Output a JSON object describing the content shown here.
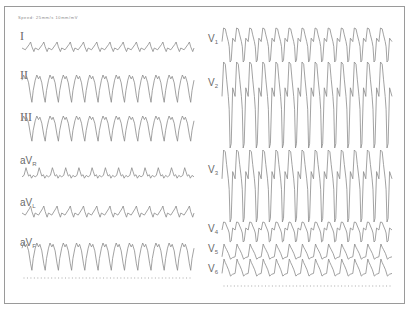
{
  "header": {
    "text": "Speed: 25mm/s  10mm/mV"
  },
  "leads_left": [
    {
      "id": "I",
      "label": "I",
      "sub": "",
      "label_x": 20,
      "label_y": 31,
      "x0": 22,
      "x1": 194,
      "base": 48,
      "amp": 6,
      "beats": 13,
      "shape": "lowpeak"
    },
    {
      "id": "II",
      "label": "II",
      "sub": "",
      "label_x": 20,
      "label_y": 70,
      "x0": 22,
      "x1": 194,
      "base": 88,
      "amp": 13,
      "beats": 13,
      "shape": "negdeep"
    },
    {
      "id": "III",
      "label": "III",
      "sub": "",
      "label_x": 20,
      "label_y": 112,
      "x0": 22,
      "x1": 194,
      "base": 128,
      "amp": 12,
      "beats": 13,
      "shape": "negdeep"
    },
    {
      "id": "aVR",
      "label": "aV",
      "sub": "R",
      "label_x": 20,
      "label_y": 156,
      "x0": 22,
      "x1": 194,
      "base": 174,
      "amp": 7,
      "beats": 13,
      "shape": "pos"
    },
    {
      "id": "aVL",
      "label": "aV",
      "sub": "L",
      "label_x": 20,
      "label_y": 198,
      "x0": 22,
      "x1": 194,
      "base": 213,
      "amp": 7,
      "beats": 13,
      "shape": "lowpeak"
    },
    {
      "id": "aVF",
      "label": "aV",
      "sub": "F",
      "label_x": 20,
      "label_y": 238,
      "x0": 22,
      "x1": 194,
      "base": 256,
      "amp": 13,
      "beats": 13,
      "shape": "negdeep"
    }
  ],
  "leads_right": [
    {
      "id": "V1",
      "label": "V",
      "sub": "1",
      "label_x": 208,
      "label_y": 34,
      "x0": 222,
      "x1": 392,
      "base": 45,
      "amp": 17,
      "beats": 13,
      "shape": "wide"
    },
    {
      "id": "V2",
      "label": "V",
      "sub": "2",
      "label_x": 208,
      "label_y": 78,
      "x0": 222,
      "x1": 392,
      "base": 105,
      "amp": 43,
      "beats": 13,
      "shape": "wide"
    },
    {
      "id": "V3",
      "label": "V",
      "sub": "3",
      "label_x": 208,
      "label_y": 165,
      "x0": 222,
      "x1": 392,
      "base": 186,
      "amp": 36,
      "beats": 13,
      "shape": "wide"
    },
    {
      "id": "V4",
      "label": "V",
      "sub": "4",
      "label_x": 208,
      "label_y": 224,
      "x0": 222,
      "x1": 392,
      "base": 232,
      "amp": 10,
      "beats": 13,
      "shape": "wide"
    },
    {
      "id": "V5",
      "label": "V",
      "sub": "5",
      "label_x": 208,
      "label_y": 244,
      "x0": 222,
      "x1": 392,
      "base": 252,
      "amp": 8,
      "beats": 13,
      "shape": "saw"
    },
    {
      "id": "V6",
      "label": "V",
      "sub": "6",
      "label_x": 208,
      "label_y": 264,
      "x0": 222,
      "x1": 392,
      "base": 268,
      "amp": 9,
      "beats": 13,
      "shape": "saw"
    }
  ],
  "calibration_rows": [
    {
      "x0": 24,
      "x1": 190,
      "y": 278,
      "ticks": 48
    },
    {
      "x0": 224,
      "x1": 390,
      "y": 286,
      "ticks": 48
    }
  ],
  "colors": {
    "trace": "#8a8a8a",
    "border": "#9a9a9a",
    "label": "#6a6a6a"
  }
}
